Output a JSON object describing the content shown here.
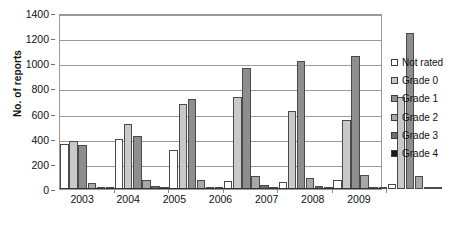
{
  "chart_data": {
    "type": "bar",
    "title": "",
    "xlabel": "",
    "ylabel": "No. of reports",
    "ylim": [
      0,
      1400
    ],
    "ytick_step": 200,
    "yticks": [
      0,
      200,
      400,
      600,
      800,
      1000,
      1200,
      1400
    ],
    "grid": true,
    "legend_position": "right",
    "categories": [
      "2003",
      "2004",
      "2005",
      "2006",
      "2007",
      "2008",
      "2009"
    ],
    "series": [
      {
        "name": "Not rated",
        "color": "#ffffff",
        "values": [
          360,
          395,
          310,
          65,
          57,
          75,
          40
        ]
      },
      {
        "name": "Grade 0",
        "color": "#c9c9c9",
        "values": [
          385,
          515,
          680,
          735,
          620,
          550,
          730
        ]
      },
      {
        "name": "Grade 1",
        "color": "#8e8e8e",
        "values": [
          350,
          425,
          715,
          960,
          1015,
          1060,
          1245
        ]
      },
      {
        "name": "Grade 2",
        "color": "#a8a8a8",
        "values": [
          45,
          70,
          70,
          100,
          90,
          115,
          100
        ]
      },
      {
        "name": "Grade 3",
        "color": "#6d6d6d",
        "values": [
          8,
          22,
          20,
          28,
          25,
          18,
          14
        ]
      },
      {
        "name": "Grade 4",
        "color": "#1a1a1a",
        "values": [
          3,
          3,
          5,
          6,
          4,
          5,
          4
        ]
      }
    ]
  }
}
